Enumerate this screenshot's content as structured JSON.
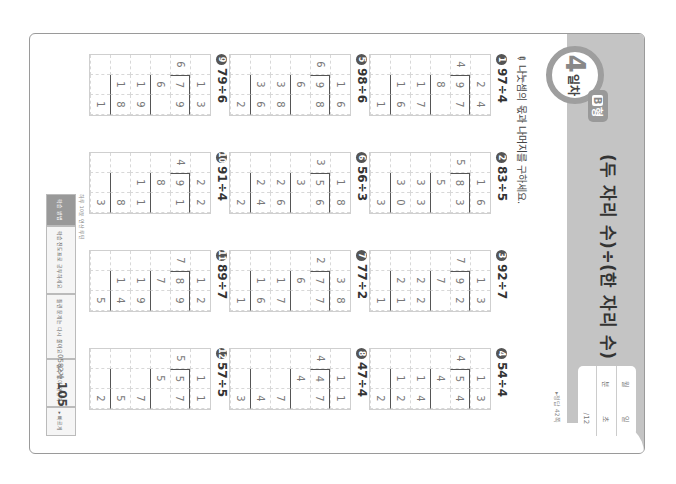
{
  "header": {
    "title": "(두 자리 수)÷(한 자리 수) (3)",
    "day_number": "4",
    "day_label": "일차",
    "type_label": "B",
    "type_suffix": "형",
    "score_box": {
      "rows": [
        {
          "label": "월",
          "value": "일"
        },
        {
          "label": "분",
          "value": "초"
        },
        {
          "label": "",
          "value": "/12"
        }
      ]
    },
    "answer_reference": "▸정답 42쪽"
  },
  "instruction": "나눗셈의 몫과 나머지를 구하세요.",
  "problems": [
    {
      "num": "1",
      "expr": "97÷4",
      "quotient": "24",
      "rows": [
        [
          "",
          "2",
          "4"
        ],
        [
          "4",
          "9",
          "7"
        ],
        [
          "",
          "8",
          ""
        ],
        [
          "",
          "1",
          "7"
        ],
        [
          "",
          "1",
          "6"
        ],
        [
          "",
          "",
          "1"
        ]
      ]
    },
    {
      "num": "2",
      "expr": "83÷5",
      "quotient": "16",
      "rows": [
        [
          "",
          "1",
          "6"
        ],
        [
          "5",
          "8",
          "3"
        ],
        [
          "",
          "5",
          ""
        ],
        [
          "",
          "3",
          "3"
        ],
        [
          "",
          "3",
          "0"
        ],
        [
          "",
          "",
          "3"
        ]
      ]
    },
    {
      "num": "3",
      "expr": "92÷7",
      "quotient": "13",
      "rows": [
        [
          "",
          "1",
          "3"
        ],
        [
          "7",
          "9",
          "2"
        ],
        [
          "",
          "7",
          ""
        ],
        [
          "",
          "2",
          "2"
        ],
        [
          "",
          "2",
          "1"
        ],
        [
          "",
          "",
          "1"
        ]
      ]
    },
    {
      "num": "4",
      "expr": "54÷4",
      "quotient": "13",
      "rows": [
        [
          "",
          "1",
          "3"
        ],
        [
          "4",
          "5",
          "4"
        ],
        [
          "",
          "4",
          ""
        ],
        [
          "",
          "1",
          "4"
        ],
        [
          "",
          "1",
          "2"
        ],
        [
          "",
          "",
          "2"
        ]
      ]
    },
    {
      "num": "5",
      "expr": "98÷6",
      "quotient": "16",
      "rows": [
        [
          "",
          "1",
          "6"
        ],
        [
          "6",
          "9",
          "8"
        ],
        [
          "",
          "6",
          ""
        ],
        [
          "",
          "3",
          "8"
        ],
        [
          "",
          "3",
          "6"
        ],
        [
          "",
          "",
          "2"
        ]
      ]
    },
    {
      "num": "6",
      "expr": "56÷3",
      "quotient": "18",
      "rows": [
        [
          "",
          "1",
          "8"
        ],
        [
          "3",
          "5",
          "6"
        ],
        [
          "",
          "3",
          ""
        ],
        [
          "",
          "2",
          "6"
        ],
        [
          "",
          "2",
          "4"
        ],
        [
          "",
          "",
          "2"
        ]
      ]
    },
    {
      "num": "7",
      "expr": "77÷2",
      "quotient": "38",
      "rows": [
        [
          "",
          "3",
          "8"
        ],
        [
          "2",
          "7",
          "7"
        ],
        [
          "",
          "6",
          ""
        ],
        [
          "",
          "1",
          "7"
        ],
        [
          "",
          "1",
          "6"
        ],
        [
          "",
          "",
          "1"
        ]
      ]
    },
    {
      "num": "8",
      "expr": "47÷4",
      "quotient": "11",
      "rows": [
        [
          "",
          "1",
          "1"
        ],
        [
          "4",
          "4",
          "7"
        ],
        [
          "",
          "4",
          ""
        ],
        [
          "",
          "",
          "7"
        ],
        [
          "",
          "",
          "4"
        ],
        [
          "",
          "",
          "3"
        ]
      ]
    },
    {
      "num": "9",
      "expr": "79÷6",
      "quotient": "13",
      "rows": [
        [
          "",
          "1",
          "3"
        ],
        [
          "6",
          "7",
          "9"
        ],
        [
          "",
          "6",
          ""
        ],
        [
          "",
          "1",
          "9"
        ],
        [
          "",
          "1",
          "8"
        ],
        [
          "",
          "",
          "1"
        ]
      ]
    },
    {
      "num": "10",
      "expr": "91÷4",
      "quotient": "22",
      "rows": [
        [
          "",
          "2",
          "2"
        ],
        [
          "4",
          "9",
          "1"
        ],
        [
          "",
          "8",
          ""
        ],
        [
          "",
          "1",
          "1"
        ],
        [
          "",
          "",
          "8"
        ],
        [
          "",
          "",
          "3"
        ]
      ]
    },
    {
      "num": "11",
      "expr": "89÷7",
      "quotient": "12",
      "rows": [
        [
          "",
          "1",
          "2"
        ],
        [
          "7",
          "8",
          "9"
        ],
        [
          "",
          "7",
          ""
        ],
        [
          "",
          "1",
          "9"
        ],
        [
          "",
          "1",
          "4"
        ],
        [
          "",
          "",
          "5"
        ]
      ]
    },
    {
      "num": "12",
      "expr": "57÷5",
      "quotient": "11",
      "rows": [
        [
          "",
          "1",
          "1"
        ],
        [
          "5",
          "5",
          "7"
        ],
        [
          "",
          "5",
          ""
        ],
        [
          "",
          "",
          "7"
        ],
        [
          "",
          "",
          "5"
        ],
        [
          "",
          "",
          "2"
        ]
      ]
    }
  ],
  "footer": {
    "note": "하루 10분 연산 루틴",
    "tabs": [
      "학습 방법",
      "학습 진도표로 공부하세요",
      "틀린 문제는 다시 풀어요",
      "실수 없이 연산력",
      "▸ 빠르게"
    ],
    "book_code": "0582계",
    "page_number": "105"
  }
}
